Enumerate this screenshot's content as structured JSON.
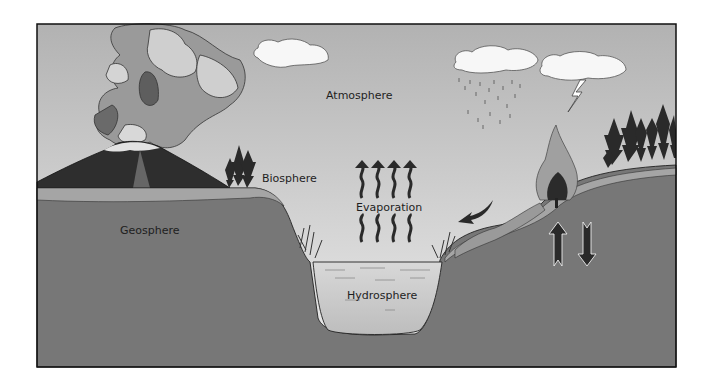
{
  "diagram": {
    "labels": {
      "atmosphere": "Atmosphere",
      "biosphere": "Biosphere",
      "geosphere": "Geosphere",
      "hydrosphere": "Hydrosphere",
      "evaporation": "Evaporation"
    },
    "elements": [
      "volcano-with-ash-plume",
      "clouds",
      "rain",
      "lightning",
      "forest-fire",
      "trees",
      "lake",
      "evaporation-arrows",
      "runoff-arrow",
      "up-down-arrows"
    ],
    "colors": {
      "sky_top": "#b4b4b4",
      "sky_bottom": "#e6e6e6",
      "ground": "#767676",
      "soil": "#a3a3a3",
      "water": "#cfcfcf",
      "frame": "#111111"
    }
  }
}
